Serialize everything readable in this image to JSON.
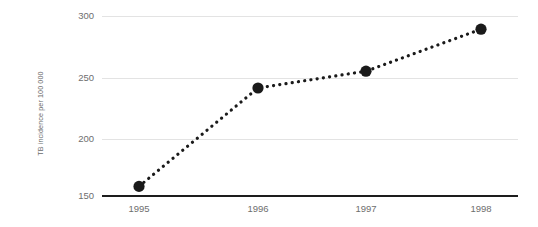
{
  "chart_data": {
    "type": "line",
    "title": "",
    "subtitle": "",
    "xlabel": "",
    "ylabel": "TB incidence per 100 000",
    "categories": [
      "1995",
      "1996",
      "1997",
      "1998"
    ],
    "x": [
      1995,
      1996,
      1997,
      1998
    ],
    "values": [
      158,
      240,
      254,
      289
    ],
    "series": [
      {
        "name": "TB incidence",
        "values": [
          158,
          240,
          254,
          289
        ]
      }
    ],
    "ylim": [
      150,
      300
    ],
    "yticks": [
      150,
      200,
      250,
      300
    ],
    "ytick_labels": [
      "150",
      "200",
      "250",
      "300"
    ],
    "xtick_labels": [
      "1995",
      "1996",
      "1997",
      "1998"
    ],
    "grid": true,
    "legend": "none",
    "line_style": "dotted",
    "marker": "circle",
    "colors": {
      "line": "#1a1a1a",
      "marker": "#1a1a1a",
      "gridline": "#e3e3e3",
      "axis": "#1d1d1d",
      "tick_text": "#6e6e6e",
      "axis_title_text": "#6b6b6b",
      "background": "#ffffff"
    }
  }
}
